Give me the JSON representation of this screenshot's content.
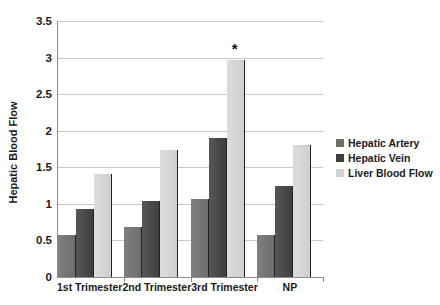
{
  "chart_data": {
    "type": "bar",
    "title": "",
    "xlabel": "",
    "ylabel": "Hepatic Blood Flow",
    "ylim": [
      0,
      3.5
    ],
    "ytick_step": 0.5,
    "yticks": [
      "0",
      "0.5",
      "1",
      "1.5",
      "2",
      "2.5",
      "3",
      "3.5"
    ],
    "ytick_values": [
      0,
      0.5,
      1,
      1.5,
      2,
      2.5,
      3,
      3.5
    ],
    "grid": "horizontal",
    "legend_position": "right",
    "categories": [
      "1st Trimester",
      "2nd Trimester",
      "3rd Trimester",
      "NP"
    ],
    "series": [
      {
        "name": "Hepatic Artery",
        "color": "#6e6e6e",
        "values": [
          0.58,
          0.69,
          1.06,
          0.57
        ]
      },
      {
        "name": "Hepatic Vein",
        "color": "#3f3f3f",
        "values": [
          0.93,
          1.04,
          1.9,
          1.24
        ]
      },
      {
        "name": "Liver Blood Flow",
        "color": "#d2d2d2",
        "values": [
          1.41,
          1.73,
          2.97,
          1.81
        ]
      }
    ],
    "annotations": [
      {
        "text": "*",
        "category": "3rd Trimester",
        "series": "Liver Blood Flow",
        "value": 2.97
      }
    ]
  }
}
